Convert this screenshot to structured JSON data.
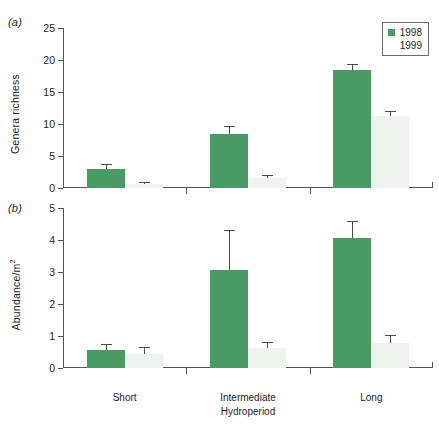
{
  "figure": {
    "panels": [
      {
        "tag": "(a)",
        "ylabel": "Genera richness",
        "ylabel_sup": ""
      },
      {
        "tag": "(b)",
        "ylabel": "Abundance/m",
        "ylabel_sup": "2"
      }
    ],
    "xaxis_title": "Hydroperiod",
    "categories": [
      "Short",
      "Intermediate",
      "Long"
    ],
    "legend": {
      "items": [
        {
          "label": "1998",
          "color": "#4a9a66"
        },
        {
          "label": "1999",
          "color": "#ffffff"
        }
      ]
    },
    "colors": {
      "series_1998": "#4a9a66",
      "series_1999": "#eef3f0",
      "axis": "#555555",
      "error_bar": "#4a4a4a",
      "background": "#ffffff"
    }
  },
  "chart_data": [
    {
      "type": "bar",
      "title": "(a)",
      "xlabel": "Hydroperiod",
      "ylabel": "Genera richness",
      "ylim": [
        0,
        25
      ],
      "yticks": [
        0,
        5,
        10,
        15,
        20,
        25
      ],
      "grid": false,
      "legend_position": "top-right",
      "categories": [
        "Short",
        "Intermediate",
        "Long"
      ],
      "series": [
        {
          "name": "1998",
          "values": [
            3.0,
            8.4,
            18.4
          ],
          "errors": [
            0.7,
            1.3,
            0.9
          ]
        },
        {
          "name": "1999",
          "values": [
            0.6,
            1.5,
            11.2
          ],
          "errors": [
            0.3,
            0.5,
            0.9
          ]
        }
      ]
    },
    {
      "type": "bar",
      "title": "(b)",
      "xlabel": "Hydroperiod",
      "ylabel": "Abundance/m2",
      "ylim": [
        0,
        5
      ],
      "yticks": [
        0,
        1,
        2,
        3,
        4,
        5
      ],
      "grid": false,
      "legend_position": "none",
      "categories": [
        "Short",
        "Intermediate",
        "Long"
      ],
      "series": [
        {
          "name": "1998",
          "values": [
            0.55,
            3.05,
            4.05
          ],
          "errors": [
            0.2,
            1.25,
            0.55
          ]
        },
        {
          "name": "1999",
          "values": [
            0.45,
            0.62,
            0.78
          ],
          "errors": [
            0.2,
            0.2,
            0.25
          ]
        }
      ]
    }
  ]
}
